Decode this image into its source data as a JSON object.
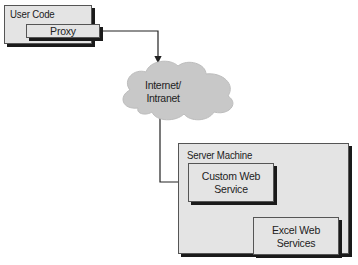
{
  "diagram": {
    "nodes": {
      "user_code": {
        "label": "User Code"
      },
      "proxy": {
        "label": "Proxy"
      },
      "cloud": {
        "line1": "Internet/",
        "line2": "Intranet"
      },
      "server_machine": {
        "label": "Server Machine"
      },
      "custom_web_service": {
        "line1": "Custom Web",
        "line2": "Service"
      },
      "excel_web_services": {
        "line1": "Excel Web",
        "line2": "Services"
      }
    },
    "edges": [
      {
        "from": "Proxy",
        "to": "Internet/Intranet"
      },
      {
        "from": "Internet/Intranet",
        "to": "Custom Web Service"
      },
      {
        "from": "Custom Web Service",
        "to": "Excel Web Services"
      }
    ],
    "colors": {
      "box_fill": "#e4e4e4",
      "cloud_fill": "#c8c8c8",
      "shadow": "#1a1a1a",
      "line": "#222222"
    }
  }
}
